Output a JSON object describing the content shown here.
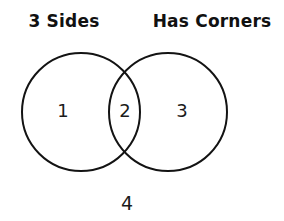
{
  "figure": {
    "type": "venn-diagram",
    "background_color": "#ffffff",
    "stroke_color": "#131313",
    "text_color": "#1b1b1b"
  },
  "labels": {
    "left": "3 Sides",
    "right": "Has Corners"
  },
  "regions": {
    "left_only": "1",
    "intersection": "2",
    "right_only": "3",
    "outside": "4"
  }
}
